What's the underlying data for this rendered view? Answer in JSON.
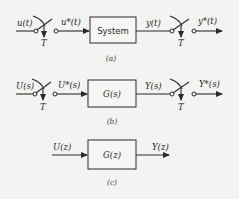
{
  "diagram": {
    "a": {
      "input": "u(t)",
      "sampled_input": "u*(t)",
      "block": "System",
      "output": "y(t)",
      "sampled_output": "y*(t)",
      "sampler_period_1": "T",
      "sampler_period_2": "T",
      "caption": "(a)"
    },
    "b": {
      "input": "U(s)",
      "sampled_input": "U*(s)",
      "block": "G(s)",
      "output": "Y(s)",
      "sampled_output": "Y*(s)",
      "sampler_period_1": "T",
      "sampler_period_2": "T",
      "caption": "(b)"
    },
    "c": {
      "input": "U(z)",
      "block": "G(z)",
      "output": "Y(z)",
      "caption": "(c)"
    }
  }
}
